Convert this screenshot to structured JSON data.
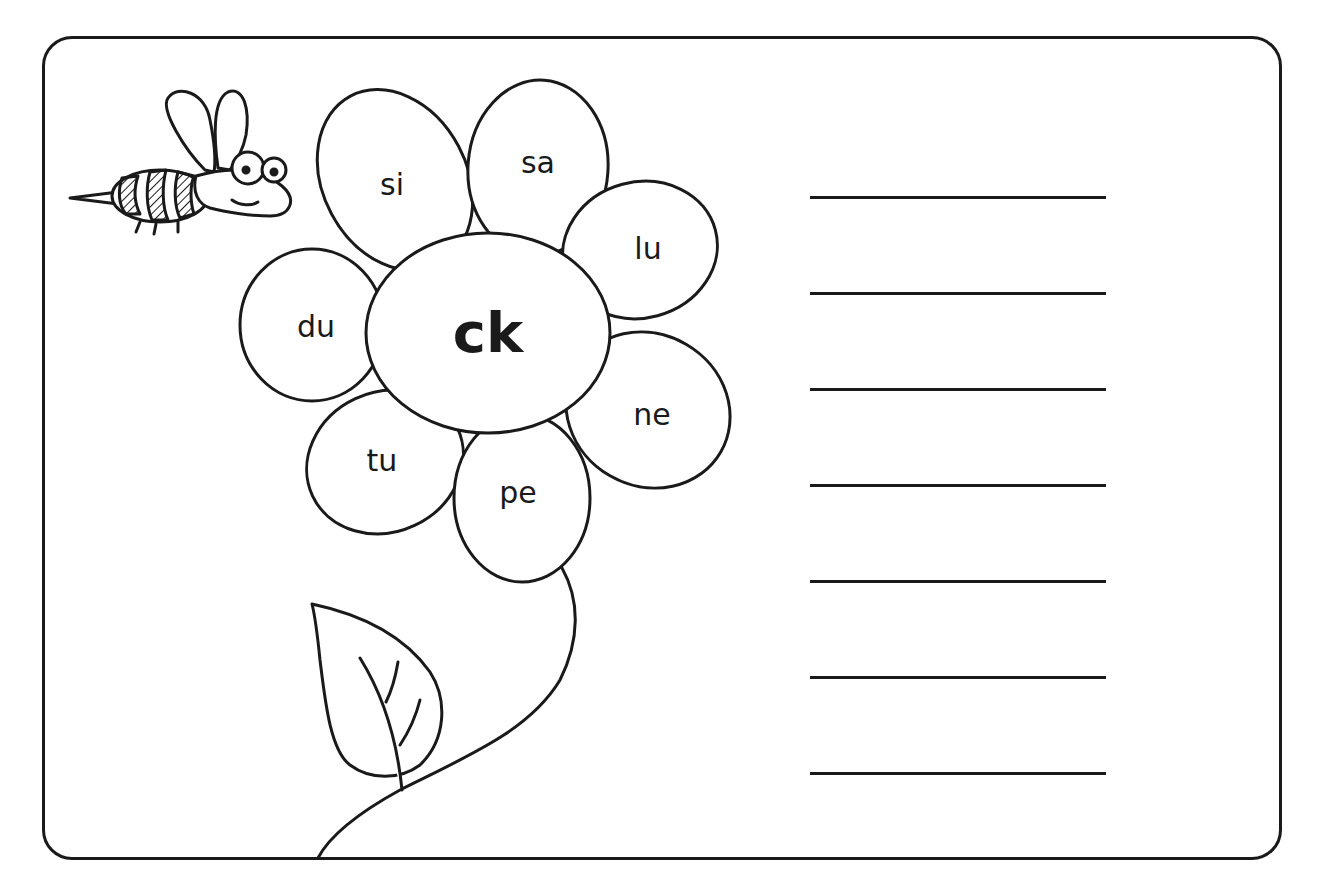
{
  "worksheet": {
    "center_sound": "ck",
    "petals": [
      {
        "label": "si",
        "x": 392,
        "y": 184
      },
      {
        "label": "sa",
        "x": 538,
        "y": 162
      },
      {
        "label": "lu",
        "x": 648,
        "y": 248
      },
      {
        "label": "du",
        "x": 316,
        "y": 326
      },
      {
        "label": "ne",
        "x": 652,
        "y": 414
      },
      {
        "label": "tu",
        "x": 382,
        "y": 460
      },
      {
        "label": "pe",
        "x": 518,
        "y": 492
      }
    ],
    "answer_lines": [
      {
        "y": 196
      },
      {
        "y": 292
      },
      {
        "y": 388
      },
      {
        "y": 484
      },
      {
        "y": 580
      },
      {
        "y": 676
      },
      {
        "y": 772
      }
    ],
    "colors": {
      "ink": "#1a1a1a",
      "paper": "#ffffff"
    }
  }
}
